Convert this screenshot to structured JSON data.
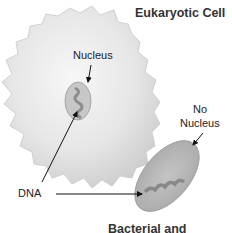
{
  "diagram": {
    "title_eukaryotic": "Eukaryotic Cell",
    "title_bacterial": "Bacterial and",
    "label_nucleus": "Nucleus",
    "label_no": "No",
    "label_no_nucleus": "Nucleus",
    "label_dna": "DNA",
    "colors": {
      "cell_fill_light": "#f2f2f2",
      "cell_fill_dark": "#cfcfcf",
      "bacterium_fill": "#b5b5b5",
      "nucleus_fill": "#c4c4c4",
      "text": "#222222"
    }
  }
}
